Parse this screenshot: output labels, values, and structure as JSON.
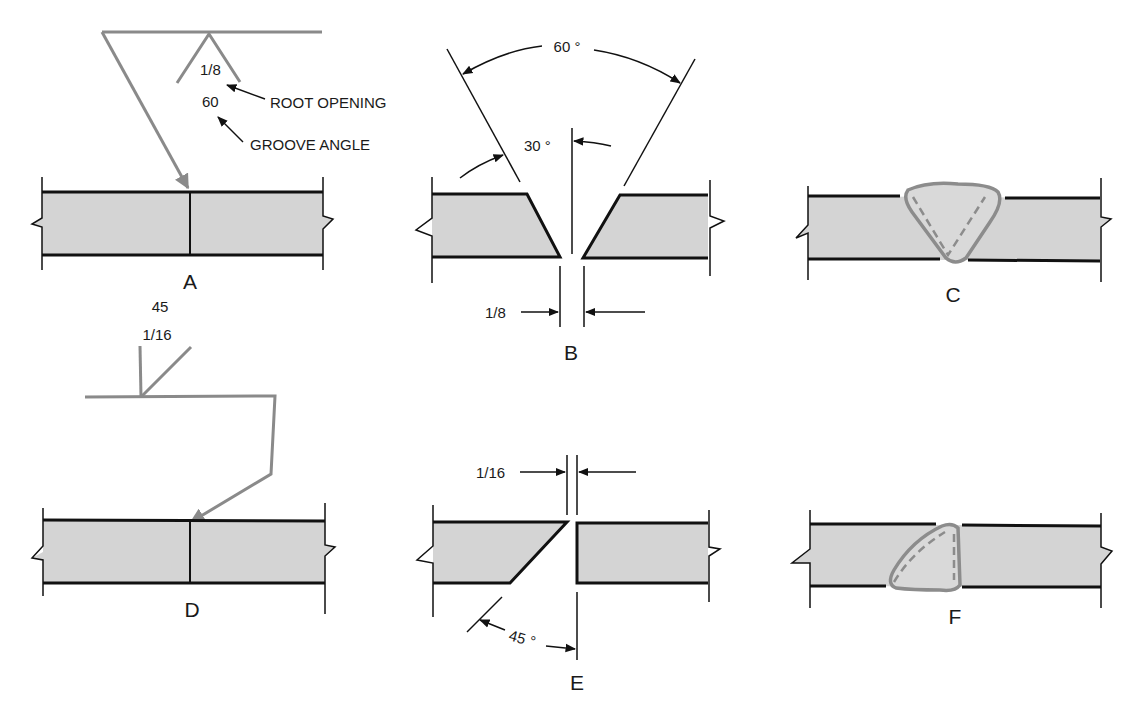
{
  "colors": {
    "plate_fill": "#d4d4d4",
    "line": "#111111",
    "symbol_line": "#8a8a8a",
    "weld_outline": "#8c8c8c"
  },
  "panels": {
    "A": {
      "label": "A",
      "symbol_root_opening": "1/8",
      "symbol_groove_angle": "60",
      "callout_root_opening": "ROOT OPENING",
      "callout_groove_angle": "GROOVE ANGLE"
    },
    "B": {
      "label": "B",
      "included_angle": "60 °",
      "bevel_angle": "30 °",
      "root_opening": "1/8"
    },
    "C": {
      "label": "C"
    },
    "D": {
      "label": "D",
      "symbol_groove_angle": "45",
      "symbol_root_opening": "1/16"
    },
    "E": {
      "label": "E",
      "root_opening": "1/16",
      "bevel_angle": "45 °"
    },
    "F": {
      "label": "F"
    }
  }
}
